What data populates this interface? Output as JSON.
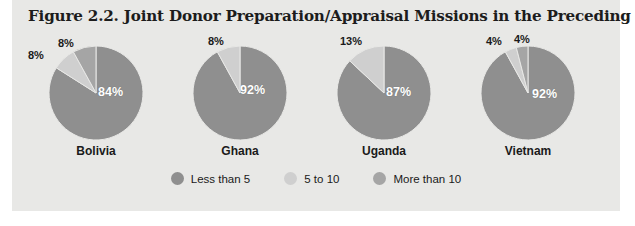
{
  "figure": {
    "title": "Figure 2.2. Joint Donor Preparation/Appraisal Missions in the Preceding 12 Months",
    "panel_bg": "#e8e8e6"
  },
  "chart_data": {
    "type": "pie",
    "title": "Figure 2.2. Joint Donor Preparation/Appraisal Missions in the Preceding 12 Months",
    "xlabel": "",
    "ylabel": "",
    "grid": false,
    "legend_position": "bottom-center",
    "value_unit": "%",
    "categories": [
      "Less than 5",
      "5 to 10",
      "More than 10"
    ],
    "category_colors": [
      "#8f8f8f",
      "#cfcfcf",
      "#a5a5a5"
    ],
    "charts": [
      {
        "name": "Bolivia",
        "slices": [
          {
            "category": "Less than 5",
            "value": 84,
            "label": "84%",
            "color": "#8f8f8f"
          },
          {
            "category": "5 to 10",
            "value": 8,
            "label": "8%",
            "color": "#cfcfcf"
          },
          {
            "category": "More than 10",
            "value": 8,
            "label": "8%",
            "color": "#a5a5a5"
          }
        ]
      },
      {
        "name": "Ghana",
        "slices": [
          {
            "category": "Less than 5",
            "value": 92,
            "label": "92%",
            "color": "#8f8f8f"
          },
          {
            "category": "5 to 10",
            "value": 8,
            "label": "8%",
            "color": "#cfcfcf"
          }
        ]
      },
      {
        "name": "Uganda",
        "slices": [
          {
            "category": "Less than 5",
            "value": 87,
            "label": "87%",
            "color": "#8f8f8f"
          },
          {
            "category": "5 to 10",
            "value": 13,
            "label": "13%",
            "color": "#cfcfcf"
          }
        ]
      },
      {
        "name": "Vietnam",
        "slices": [
          {
            "category": "Less than 5",
            "value": 92,
            "label": "92%",
            "color": "#8f8f8f"
          },
          {
            "category": "5 to 10",
            "value": 4,
            "label": "4%",
            "color": "#cfcfcf"
          },
          {
            "category": "More than 10",
            "value": 4,
            "label": "4%",
            "color": "#a5a5a5"
          }
        ]
      }
    ]
  },
  "pies": [
    {
      "country": "Bolivia",
      "inner": {
        "text": "84%",
        "left": "78px",
        "top": "52px"
      },
      "outer": [
        {
          "text": "8%",
          "left": "8px",
          "top": "16px"
        },
        {
          "text": "8%",
          "left": "38px",
          "top": "4px"
        }
      ]
    },
    {
      "country": "Ghana",
      "inner": {
        "text": "92%",
        "left": "76px",
        "top": "50px"
      },
      "outer": [
        {
          "text": "8%",
          "left": "44px",
          "top": "2px"
        }
      ]
    },
    {
      "country": "Uganda",
      "inner": {
        "text": "87%",
        "left": "78px",
        "top": "52px"
      },
      "outer": [
        {
          "text": "13%",
          "left": "32px",
          "top": "2px"
        }
      ]
    },
    {
      "country": "Vietnam",
      "inner": {
        "text": "92%",
        "left": "80px",
        "top": "54px"
      },
      "outer": [
        {
          "text": "4%",
          "left": "34px",
          "top": "2px"
        },
        {
          "text": "4%",
          "left": "62px",
          "top": "0px"
        }
      ]
    }
  ],
  "legend": {
    "items": [
      {
        "label": "Less than 5",
        "color": "#8f8f8f"
      },
      {
        "label": "5 to 10",
        "color": "#cfcfcf"
      },
      {
        "label": "More than 10",
        "color": "#a5a5a5"
      }
    ]
  }
}
